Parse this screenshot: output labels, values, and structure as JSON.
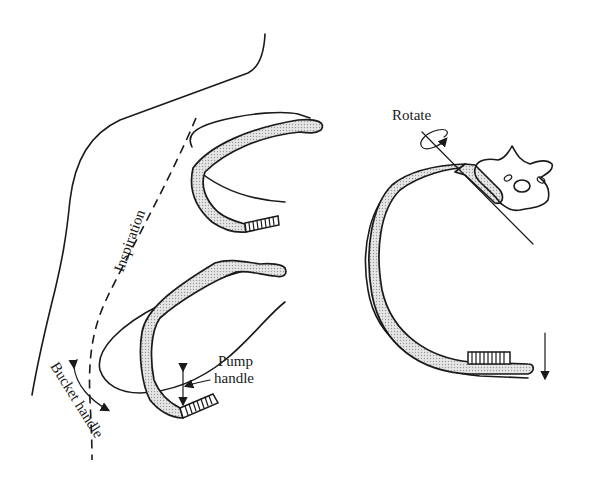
{
  "figure": {
    "labels": {
      "inspiration": "Inspiration",
      "rotate": "Rotate",
      "pump_handle_line1": "Pump",
      "pump_handle_line2": "handle",
      "bucket_handle": "Bucket handle"
    },
    "colors": {
      "ink": "#1a1a1a",
      "background": "#ffffff",
      "bone_shading": "#c8c8c8"
    }
  }
}
